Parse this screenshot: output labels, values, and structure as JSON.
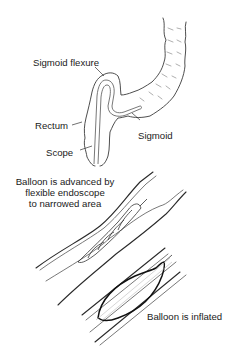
{
  "figure": {
    "panels": [
      {
        "name": "colon-with-scope",
        "labels": {
          "sigmoid_flexure": "Sigmoid flexure",
          "rectum": "Rectum",
          "scope": "Scope",
          "sigmoid": "Sigmoid"
        }
      },
      {
        "name": "balloon-advanced",
        "caption_lines": [
          "Balloon is advanced by",
          "flexible endoscope",
          "to narrowed area"
        ]
      },
      {
        "name": "balloon-inflated",
        "caption": "Balloon is inflated"
      }
    ],
    "colors": {
      "background": "#ffffff",
      "ink": "#1a1a1a",
      "haustra": "#9a9a9a"
    }
  }
}
